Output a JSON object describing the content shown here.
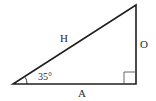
{
  "diagram": {
    "type": "right-triangle",
    "labels": {
      "hypotenuse": "H",
      "opposite": "O",
      "adjacent": "A",
      "angle": "35°"
    },
    "colors": {
      "stroke": "#1f1f1f",
      "text": "#2a2a2a",
      "background": "#ffffff"
    }
  }
}
